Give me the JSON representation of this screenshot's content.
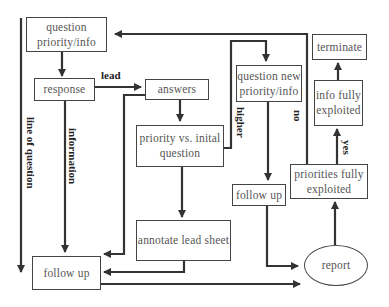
{
  "diagram": {
    "type": "flowchart",
    "nodes": {
      "question_priority": "question priority/info",
      "response": "response",
      "answers": "answers",
      "priority_vs_initial": "priority vs. inital question",
      "annotate_lead_sheet": "annotate lead sheet",
      "follow_up_left": "follow up",
      "question_new_priority": "question new priority/info",
      "follow_up_right": "follow up",
      "priorities_fully_exploited": "priorities fully exploited",
      "info_fully_exploited": "info fully exploited",
      "terminate": "terminate",
      "report": "report"
    },
    "edge_labels": {
      "lead": "lead",
      "information": "information",
      "line_of_question": "line of question",
      "higher": "higher",
      "no": "no",
      "yes": "yes"
    },
    "edges": [
      {
        "from": "question_priority",
        "to": "response"
      },
      {
        "from": "response",
        "to": "answers",
        "label": "lead"
      },
      {
        "from": "response",
        "to": "follow_up_left",
        "label": "information"
      },
      {
        "from": "answers",
        "to": "priority_vs_initial"
      },
      {
        "from": "answers",
        "to": "follow_up_left"
      },
      {
        "from": "priority_vs_initial",
        "to": "annotate_lead_sheet"
      },
      {
        "from": "priority_vs_initial",
        "to": "question_new_priority",
        "label": "higher"
      },
      {
        "from": "annotate_lead_sheet",
        "to": "follow_up_left"
      },
      {
        "from": "question_new_priority",
        "to": "follow_up_right"
      },
      {
        "from": "follow_up_right",
        "to": "report"
      },
      {
        "from": "follow_up_left",
        "to": "report"
      },
      {
        "from": "report",
        "to": "priorities_fully_exploited"
      },
      {
        "from": "priorities_fully_exploited",
        "to": "info_fully_exploited",
        "label": "yes"
      },
      {
        "from": "priorities_fully_exploited",
        "to": "question_priority",
        "label": "no"
      },
      {
        "from": "info_fully_exploited",
        "to": "terminate"
      }
    ],
    "colors": {
      "line": "#333333",
      "box_border": "#444444",
      "text": "#555555",
      "label": "#222222"
    }
  }
}
